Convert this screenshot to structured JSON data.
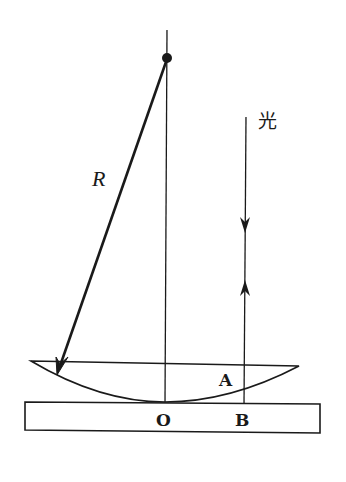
{
  "diagram": {
    "colors": {
      "stroke": "#1a1a1a",
      "background": "#ffffff"
    },
    "labels": {
      "radius": "R",
      "light": "光",
      "point_a": "A",
      "point_o": "O",
      "point_b": "B"
    },
    "elements": {
      "center_of_curvature": {
        "x": 167,
        "y": 58
      },
      "optical_axis": {
        "x": 166,
        "y_top": 30,
        "y_bottom": 402
      },
      "radius_arrow": {
        "from": [
          167,
          58
        ],
        "to": [
          58,
          372
        ]
      },
      "light_ray": {
        "x": 245,
        "y_top": 117,
        "y_bottom": 404,
        "down_arrow_y": 228,
        "up_arrow_y": 284
      },
      "lens": {
        "left": 31,
        "right": 299,
        "top_y": 361,
        "bottom_y": 402
      },
      "glass_plate": {
        "x": 25,
        "y": 402,
        "width": 295,
        "height": 30
      }
    }
  }
}
